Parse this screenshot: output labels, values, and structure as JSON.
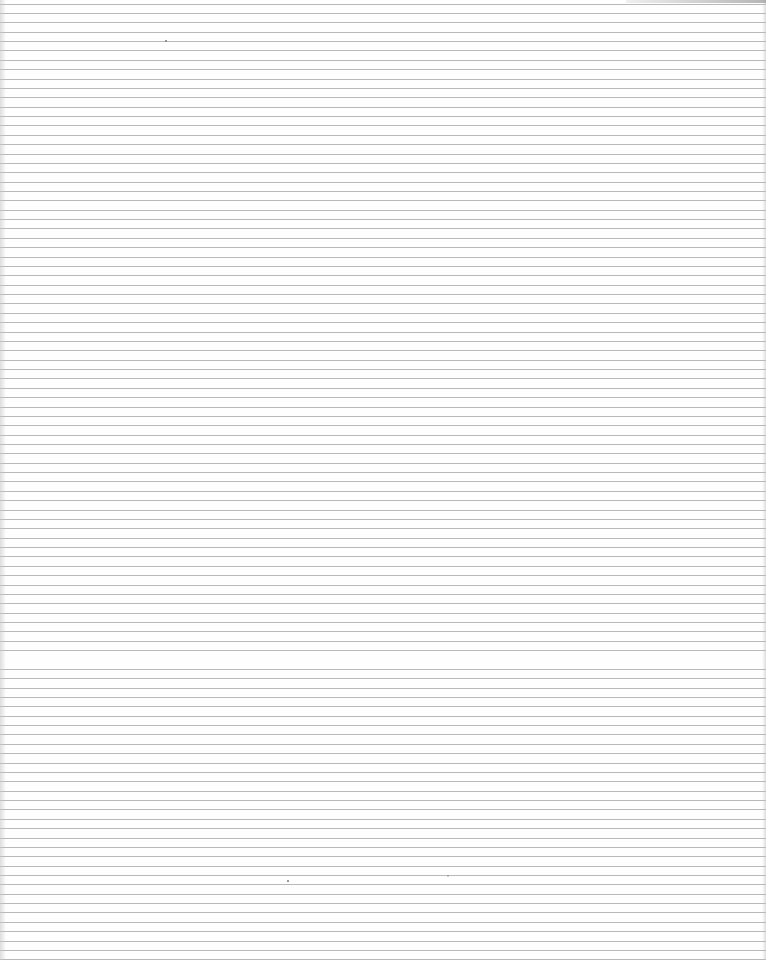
{
  "page": {
    "type": "ruled-paper-scan",
    "background_color": "#fefefe",
    "line_color": "#b9b9b9",
    "line_spacing_px": 9.37,
    "line_count": 102
  },
  "marks": [
    {
      "name": "speck",
      "x": 165,
      "y": 40
    },
    {
      "name": "speck",
      "x": 287,
      "y": 880
    },
    {
      "name": "speck",
      "x": 447,
      "y": 875
    }
  ]
}
